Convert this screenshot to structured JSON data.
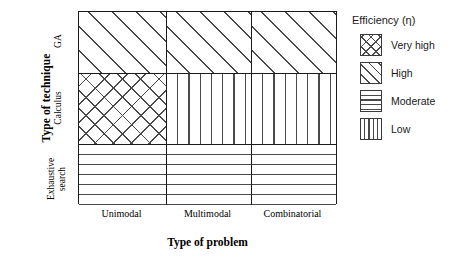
{
  "chart_data": {
    "type": "heatmap",
    "title": "",
    "xlabel": "Type of problem",
    "ylabel": "Type of technique",
    "categories": [
      "Unimodal",
      "Multimodal",
      "Combinatorial"
    ],
    "rows": [
      "GA",
      "Calculus",
      "Exhaustive search"
    ],
    "grid": true,
    "legend_position": "right",
    "legend_title": "Efficiency (η)",
    "legend_entries": [
      {
        "label": "Very high",
        "pattern": "crosshatch"
      },
      {
        "label": "High",
        "pattern": "diagonal"
      },
      {
        "label": "Moderate",
        "pattern": "horizontal"
      },
      {
        "label": "Low",
        "pattern": "vertical"
      }
    ],
    "series": [
      {
        "name": "GA",
        "values": [
          "High",
          "High",
          "High"
        ]
      },
      {
        "name": "Calculus",
        "values": [
          "Very high",
          "Low",
          "Low"
        ]
      },
      {
        "name": "Exhaustive search",
        "values": [
          "Moderate",
          "Moderate",
          "Moderate"
        ]
      }
    ],
    "cells": [
      {
        "row": "GA",
        "col": "Unimodal",
        "value": "High",
        "pattern": "diagonal"
      },
      {
        "row": "GA",
        "col": "Multimodal",
        "value": "High",
        "pattern": "diagonal"
      },
      {
        "row": "GA",
        "col": "Combinatorial",
        "value": "High",
        "pattern": "diagonal"
      },
      {
        "row": "Calculus",
        "col": "Unimodal",
        "value": "Very high",
        "pattern": "crosshatch"
      },
      {
        "row": "Calculus",
        "col": "Multimodal",
        "value": "Low",
        "pattern": "vertical"
      },
      {
        "row": "Calculus",
        "col": "Combinatorial",
        "value": "Low",
        "pattern": "vertical"
      },
      {
        "row": "Exhaustive search",
        "col": "Unimodal",
        "value": "Moderate",
        "pattern": "horizontal"
      },
      {
        "row": "Exhaustive search",
        "col": "Multimodal",
        "value": "Moderate",
        "pattern": "horizontal"
      },
      {
        "row": "Exhaustive search",
        "col": "Combinatorial",
        "value": "Moderate",
        "pattern": "horizontal"
      }
    ]
  },
  "axes": {
    "y_title": "Type of technique",
    "x_title": "Type of problem",
    "y_ticks": {
      "ga": "GA",
      "calculus": "Calculus",
      "exhaustive_line1": "Exhaustive",
      "exhaustive_line2": "search"
    },
    "x_ticks": {
      "unimodal": "Unimodal",
      "multimodal": "Multimodal",
      "combinatorial": "Combinatorial"
    }
  },
  "legend": {
    "title": "Efficiency (η)",
    "items": [
      {
        "label": "Very high"
      },
      {
        "label": "High"
      },
      {
        "label": "Moderate"
      },
      {
        "label": "Low"
      }
    ]
  },
  "colors": {
    "hatch": "#4a4a4a",
    "border": "#1a1a1a",
    "background": "#ffffff"
  }
}
